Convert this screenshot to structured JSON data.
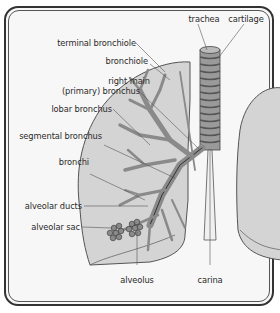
{
  "diagram": {
    "labels": {
      "trachea": "trachea",
      "cartilage": "cartilage",
      "terminal_bronchiole": "terminal bronchiole",
      "bronchiole": "bronchiole",
      "right_main_bronchus_1": "right main",
      "right_main_bronchus_2": "(primary) bronchus",
      "lobar_bronchus": "lobar bronchus",
      "segmental_bronchus": "segmental bronchus",
      "bronchi": "bronchi",
      "alveolar_ducts": "alveolar ducts",
      "alveolar_sac": "alveolar sac",
      "alveolus": "alveolus",
      "carina": "carina"
    },
    "colors": {
      "background": "#f7f7f7",
      "lung_fill": "#d4d4d4",
      "airway_fill": "#a8a8a8",
      "cartilage_ring": "#7a7a7a",
      "outline": "#444444",
      "label_text": "#2a2a2a"
    }
  }
}
